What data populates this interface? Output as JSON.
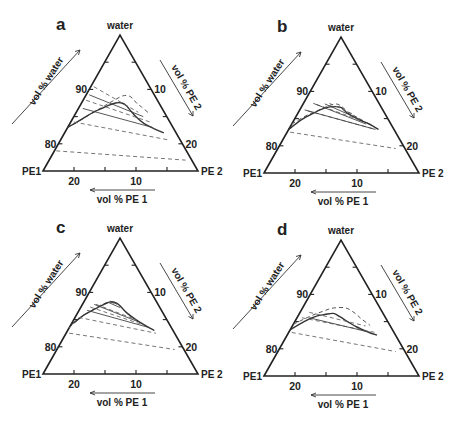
{
  "figure": {
    "vertex_labels": {
      "top": "water",
      "left": "PE1",
      "right": "PE 2"
    },
    "axis_titles": {
      "left": "vol % water",
      "right": "vol % PE 2",
      "bottom": "vol % PE 1"
    },
    "ticks": {
      "left_labels": [
        {
          "value": 90,
          "label": "90"
        },
        {
          "value": 80,
          "label": "80"
        }
      ],
      "right_labels": [
        {
          "value": 10,
          "label": "10"
        },
        {
          "value": 20,
          "label": "20"
        }
      ],
      "bottom_labels": [
        {
          "value": 20,
          "label": "20"
        },
        {
          "value": 10,
          "label": "10"
        }
      ],
      "minor_step": 5
    },
    "range": {
      "water_min": 75,
      "water_max": 100
    },
    "colors": {
      "ink": "#222222",
      "background": "#ffffff"
    }
  },
  "panels": [
    {
      "id": "a",
      "label": "a",
      "origin": [
        0,
        0
      ],
      "binodal_solid": [
        [
          17,
          0
        ],
        [
          14,
          1.5
        ],
        [
          11,
          3
        ],
        [
          8.5,
          4.5
        ],
        [
          7,
          5.5
        ],
        [
          6,
          6.5
        ],
        [
          5.5,
          7.5
        ],
        [
          5.3,
          8.5
        ],
        [
          5,
          10
        ],
        [
          4.3,
          12
        ],
        [
          3.2,
          14
        ],
        [
          2,
          16
        ]
      ],
      "binodal_dashed": [
        [
          17,
          0
        ],
        [
          12,
          2.5
        ],
        [
          9,
          4
        ],
        [
          7,
          5
        ],
        [
          5.2,
          6
        ],
        [
          4.2,
          7
        ],
        [
          3.8,
          8
        ],
        [
          3.6,
          9
        ],
        [
          3.2,
          10
        ],
        [
          2.5,
          12
        ]
      ],
      "tie_solid": [
        [
          [
            10.5,
            0.5
          ],
          [
            3.8,
            11.2
          ]
        ],
        [
          [
            12.8,
            0.7
          ],
          [
            3.3,
            13.7
          ]
        ]
      ],
      "tie_dashed": [
        [
          [
            9,
            0.5
          ],
          [
            4.2,
            10
          ]
        ],
        [
          [
            11.5,
            0.5
          ],
          [
            3.2,
            12.8
          ]
        ],
        [
          [
            15.5,
            0.5
          ],
          [
            1.8,
            17.5
          ]
        ],
        [
          [
            21,
            0.3
          ],
          [
            1,
            22
          ]
        ]
      ]
    },
    {
      "id": "b",
      "label": "b",
      "origin": [
        221,
        2
      ],
      "binodal_solid": [
        [
          17,
          0
        ],
        [
          14,
          1.2
        ],
        [
          11.5,
          2.5
        ],
        [
          9,
          4
        ],
        [
          7.3,
          5.5
        ],
        [
          6.5,
          6.5
        ],
        [
          6,
          8
        ],
        [
          5,
          10
        ],
        [
          3.5,
          12.5
        ],
        [
          2.5,
          14.5
        ]
      ],
      "binodal_dashed": [
        [
          16,
          0
        ],
        [
          13,
          1.5
        ],
        [
          10.5,
          3
        ],
        [
          8.5,
          4.2
        ],
        [
          7,
          5.3
        ],
        [
          6.3,
          6.5
        ],
        [
          5.8,
          8
        ],
        [
          4.8,
          10
        ],
        [
          3.5,
          12.5
        ]
      ],
      "tie_solid": [
        [
          [
            8.8,
            3.5
          ],
          [
            4.6,
            10.5
          ]
        ],
        [
          [
            10.6,
            1.6
          ],
          [
            4,
            12
          ]
        ],
        [
          [
            12.6,
            0.8
          ],
          [
            3,
            14
          ]
        ]
      ],
      "tie_dashed": [
        [
          [
            8,
            4.2
          ],
          [
            5.3,
            8.8
          ]
        ],
        [
          [
            10.2,
            2.2
          ],
          [
            4.4,
            11
          ]
        ],
        [
          [
            12.2,
            1.4
          ],
          [
            3.2,
            13.7
          ]
        ],
        [
          [
            17,
            0.5
          ],
          [
            1.5,
            19
          ]
        ]
      ]
    },
    {
      "id": "c",
      "label": "c",
      "origin": [
        0,
        203
      ],
      "binodal_solid": [
        [
          16,
          0
        ],
        [
          13,
          1.2
        ],
        [
          10.5,
          2.5
        ],
        [
          8.5,
          3.6
        ],
        [
          7.2,
          4.5
        ],
        [
          6.5,
          5.5
        ],
        [
          6.2,
          6.5
        ],
        [
          5.8,
          8
        ],
        [
          5,
          10
        ],
        [
          3.8,
          12.5
        ],
        [
          3,
          14
        ]
      ],
      "binodal_dashed": [
        [
          16.5,
          0
        ],
        [
          13.5,
          1
        ],
        [
          11,
          2.2
        ],
        [
          9,
          3.2
        ],
        [
          7.6,
          4.2
        ],
        [
          7,
          5
        ]
      ],
      "tie_solid": [
        [
          [
            7.4,
            4.2
          ],
          [
            6.6,
            5.6
          ]
        ],
        [
          [
            7.9,
            3.9
          ],
          [
            6.4,
            6.4
          ]
        ],
        [
          [
            12,
            1.3
          ],
          [
            3.5,
            13
          ]
        ],
        [
          [
            10.3,
            1.9
          ],
          [
            4.8,
            10.6
          ]
        ]
      ],
      "tie_dashed": [
        [
          [
            10,
            2.2
          ],
          [
            5,
            10
          ]
        ],
        [
          [
            11.2,
            1.5
          ],
          [
            4.2,
            11.8
          ]
        ],
        [
          [
            14,
            0.6
          ],
          [
            3,
            14.5
          ]
        ],
        [
          [
            17,
            0.5
          ],
          [
            1.5,
            19
          ]
        ]
      ]
    },
    {
      "id": "d",
      "label": "d",
      "origin": [
        221,
        205
      ],
      "binodal_solid": [
        [
          16.5,
          0
        ],
        [
          13.5,
          1.5
        ],
        [
          11,
          3
        ],
        [
          9.5,
          4.2
        ],
        [
          8,
          5.5
        ],
        [
          7.2,
          7
        ],
        [
          6.5,
          8.5
        ],
        [
          5.5,
          10.5
        ],
        [
          4,
          13
        ],
        [
          3,
          14.5
        ]
      ],
      "binodal_dashed": [
        [
          15.5,
          0
        ],
        [
          12,
          2
        ],
        [
          9.5,
          3.6
        ],
        [
          7.5,
          5
        ],
        [
          5.5,
          7
        ],
        [
          4.5,
          9
        ],
        [
          4,
          10.5
        ],
        [
          3.2,
          12.5
        ]
      ],
      "tie_solid": [
        [
          [
            12.3,
            2
          ],
          [
            3.8,
            13.2
          ]
        ]
      ],
      "tie_dashed": [
        [
          [
            11.8,
            1.5
          ],
          [
            4,
            11.8
          ]
        ],
        [
          [
            13.5,
            0.8
          ],
          [
            3,
            14
          ]
        ],
        [
          [
            16.5,
            0.5
          ],
          [
            1.5,
            19
          ]
        ]
      ]
    }
  ]
}
